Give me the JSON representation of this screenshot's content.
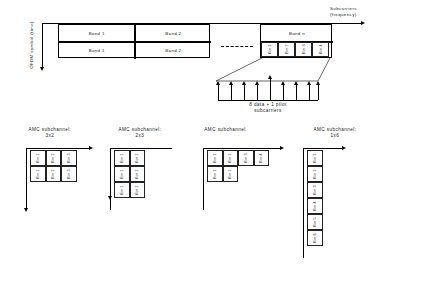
{
  "diagram": {
    "title_top_right": "Subcarriers\n(frequency)",
    "axis_y_label": "OFDM symbol (time)",
    "fan_caption": "8 data + 1 pilot\nsubcarriers",
    "dashed_separator": "------",
    "band_row1": [
      "Band 1",
      "Band 2"
    ],
    "band_row2": [
      "Band 1",
      "Band 2"
    ],
    "band_n": "Band n",
    "band_n_bins": [
      "Bin 1",
      "Bin 2",
      "Bin 3",
      "Bin 4"
    ],
    "arrow_count_label": "9"
  },
  "groups": [
    {
      "caption": "AMC subchannel:\n3x2",
      "rows": [
        [
          "Bin 1",
          "Bin 2",
          "Bin 3"
        ],
        [
          "Bin 1",
          "Bin 2",
          "Bin 3"
        ]
      ]
    },
    {
      "caption": "AMC subchannel:\n2x3",
      "rows": [
        [
          "Bin 1",
          "Bin 2"
        ],
        [
          "Bin 1",
          "Bin 2"
        ],
        [
          "Bin 1",
          "Bin 2"
        ]
      ]
    },
    {
      "caption": "AMC subchannel",
      "rows": [
        [
          "Bin 1",
          "Bin 2",
          "Bin 3",
          "Bin 4"
        ],
        [
          "Bin 1",
          "Bin 2"
        ]
      ]
    },
    {
      "caption": "AMC subchannel:\n1x6",
      "rows": [
        [
          "Bin 1"
        ],
        [
          "Bin 2"
        ],
        [
          "Bin 3"
        ],
        [
          "Bin 4"
        ],
        [
          "Bin 5"
        ],
        [
          "Bin 6"
        ]
      ]
    }
  ],
  "colors": {
    "line": "#000000",
    "text": "#1b1b1b",
    "background": "#ffffff"
  }
}
